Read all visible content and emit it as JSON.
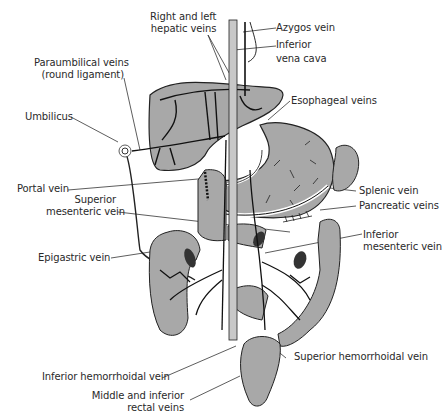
{
  "diagram": {
    "colors": {
      "organ_fill": "#a8a8a8",
      "vein_stroke": "#1a1a1a",
      "leader_line": "#333333",
      "text": "#2a2a2a",
      "background": "#ffffff"
    },
    "labels": [
      {
        "id": "right-left-hepatic",
        "lines": [
          "Right and left",
          "hepatic veins"
        ]
      },
      {
        "id": "azygos",
        "lines": [
          "Azygos vein"
        ]
      },
      {
        "id": "ivc",
        "lines": [
          "Inferior",
          "vena cava"
        ]
      },
      {
        "id": "paraumbilical",
        "lines": [
          "Paraumbilical veins",
          "(round ligament)"
        ]
      },
      {
        "id": "umbilicus",
        "lines": [
          "Umbilicus"
        ]
      },
      {
        "id": "esophageal",
        "lines": [
          "Esophageal veins"
        ]
      },
      {
        "id": "portal",
        "lines": [
          "Portal vein"
        ]
      },
      {
        "id": "sup-mesenteric",
        "lines": [
          "Superior",
          "mesenteric vein"
        ]
      },
      {
        "id": "splenic",
        "lines": [
          "Splenic vein"
        ]
      },
      {
        "id": "pancreatic",
        "lines": [
          "Pancreatic veins"
        ]
      },
      {
        "id": "inf-mesenteric",
        "lines": [
          "Inferior",
          "mesenteric vein"
        ]
      },
      {
        "id": "epigastric",
        "lines": [
          "Epigastric vein"
        ]
      },
      {
        "id": "sup-hemorrhoidal",
        "lines": [
          "Superior hemorrhoidal vein"
        ]
      },
      {
        "id": "inf-hemorrhoidal",
        "lines": [
          "Inferior hemorrhoidal vein"
        ]
      },
      {
        "id": "rectal",
        "lines": [
          "Middle and inferior",
          "rectal veins"
        ]
      }
    ]
  }
}
